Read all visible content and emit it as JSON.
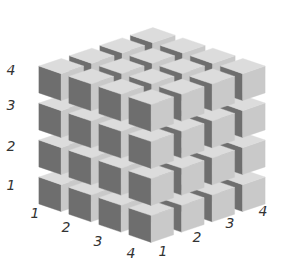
{
  "diagram": {
    "type": "4x4x4 cube lattice",
    "grid_size": 4,
    "colors": {
      "top_face": "#dcdcdc",
      "left_face": "#6e6e6e",
      "right_face": "#c9c9c9",
      "label": "#333333",
      "background": "#ffffff"
    },
    "vertical_labels": [
      "4",
      "3",
      "2",
      "1"
    ],
    "left_axis_labels": [
      "1",
      "2",
      "3",
      "4"
    ],
    "right_axis_labels": [
      "1",
      "2",
      "3",
      "4"
    ]
  },
  "labels": {
    "vertical": [
      {
        "text": "4",
        "x": 11,
        "y": 70
      },
      {
        "text": "3",
        "x": 11,
        "y": 105
      },
      {
        "text": "2",
        "x": 11,
        "y": 146
      },
      {
        "text": "1",
        "x": 11,
        "y": 185
      }
    ],
    "left_axis": [
      {
        "text": "1",
        "x": 35,
        "y": 213
      },
      {
        "text": "2",
        "x": 66,
        "y": 227
      },
      {
        "text": "3",
        "x": 98,
        "y": 241
      },
      {
        "text": "4",
        "x": 131,
        "y": 253
      }
    ],
    "right_axis": [
      {
        "text": "1",
        "x": 163,
        "y": 251
      },
      {
        "text": "2",
        "x": 197,
        "y": 237
      },
      {
        "text": "3",
        "x": 230,
        "y": 223
      },
      {
        "text": "4",
        "x": 263,
        "y": 211
      }
    ]
  }
}
